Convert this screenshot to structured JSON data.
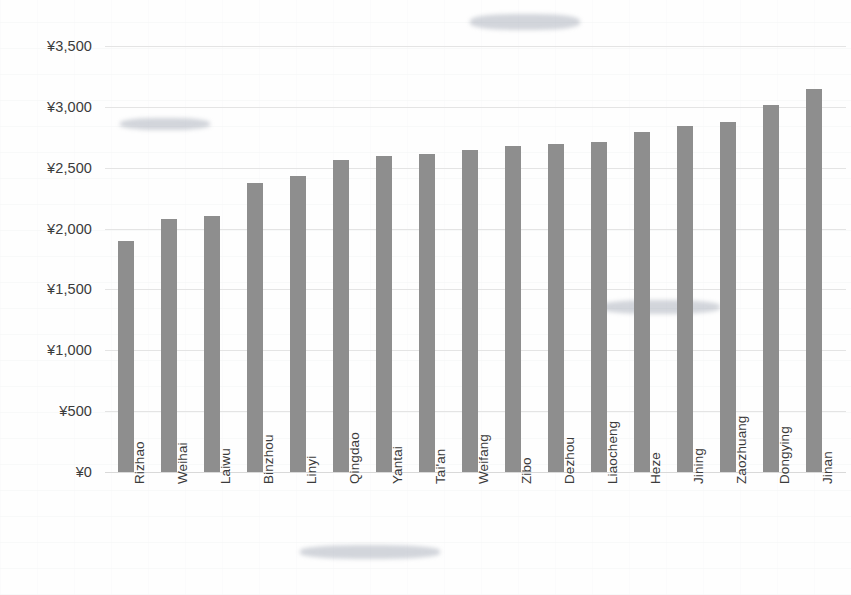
{
  "chart_data": {
    "type": "bar",
    "title": "",
    "xlabel": "",
    "ylabel": "",
    "ylim": [
      0,
      3500
    ],
    "ytick_labels": [
      "¥3,500",
      "¥3,000",
      "¥2,500",
      "¥2,000",
      "¥1,500",
      "¥1,000",
      "¥500",
      "¥0"
    ],
    "ytick_values": [
      3500,
      3000,
      2500,
      2000,
      1500,
      1000,
      500,
      0
    ],
    "currency_symbol": "¥",
    "grid": true,
    "legend": false,
    "orientation": "vertical",
    "bar_color": "#8e8e8e",
    "categories": [
      "Rizhao",
      "Weihai",
      "Laiwu",
      "Binzhou",
      "Linyi",
      "Qingdao",
      "Yantai",
      "Tai'an",
      "Weifang",
      "Zibo",
      "Dezhou",
      "Liaocheng",
      "Heze",
      "Jining",
      "Zaozhuang",
      "Dongying",
      "Jinan"
    ],
    "values": [
      1900,
      2080,
      2105,
      2375,
      2430,
      2565,
      2600,
      2615,
      2645,
      2675,
      2695,
      2710,
      2790,
      2845,
      2875,
      3015,
      3150
    ]
  }
}
